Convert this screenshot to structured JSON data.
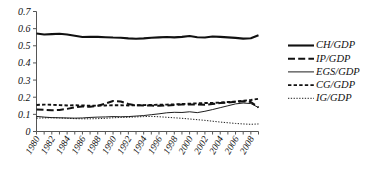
{
  "chart_data": {
    "type": "line",
    "title": "",
    "subtitle": "",
    "xlabel": "",
    "ylabel": "",
    "xlim": [
      1980,
      2009
    ],
    "ylim": [
      0,
      0.7
    ],
    "grid": false,
    "legend_position": "right",
    "y_ticks": [
      "0",
      "0.1",
      "0.2",
      "0.3",
      "0.4",
      "0.5",
      "0.6",
      "0.7"
    ],
    "y_tick_values": [
      0,
      0.1,
      0.2,
      0.3,
      0.4,
      0.5,
      0.6,
      0.7
    ],
    "x_tick_labels": [
      "1980",
      "1982",
      "1984",
      "1986",
      "1988",
      "1990",
      "1992",
      "1994",
      "1996",
      "1998",
      "2000",
      "2002",
      "2004",
      "2006",
      "2008"
    ],
    "x": [
      1980,
      1981,
      1982,
      1983,
      1984,
      1985,
      1986,
      1987,
      1988,
      1989,
      1990,
      1991,
      1992,
      1993,
      1994,
      1995,
      1996,
      1997,
      1998,
      1999,
      2000,
      2001,
      2002,
      2003,
      2004,
      2005,
      2006,
      2007,
      2008,
      2009
    ],
    "series": [
      {
        "name": "CH/GDP",
        "style": "solid-thick",
        "color": "#111111",
        "values": [
          0.572,
          0.566,
          0.568,
          0.57,
          0.566,
          0.558,
          0.551,
          0.553,
          0.552,
          0.55,
          0.548,
          0.547,
          0.543,
          0.541,
          0.543,
          0.547,
          0.549,
          0.551,
          0.549,
          0.552,
          0.557,
          0.55,
          0.548,
          0.554,
          0.552,
          0.549,
          0.546,
          0.542,
          0.544,
          0.562
        ]
      },
      {
        "name": "IP/GDP",
        "style": "dashed-long-thick",
        "color": "#111111",
        "values": [
          0.128,
          0.126,
          0.124,
          0.126,
          0.132,
          0.141,
          0.146,
          0.144,
          0.15,
          0.163,
          0.178,
          0.175,
          0.16,
          0.153,
          0.152,
          0.151,
          0.15,
          0.152,
          0.155,
          0.157,
          0.158,
          0.158,
          0.156,
          0.16,
          0.166,
          0.169,
          0.173,
          0.176,
          0.172,
          0.14
        ]
      },
      {
        "name": "EGS/GDP",
        "style": "solid-thin",
        "color": "#111111",
        "values": [
          0.088,
          0.084,
          0.081,
          0.08,
          0.079,
          0.078,
          0.079,
          0.082,
          0.084,
          0.085,
          0.087,
          0.086,
          0.087,
          0.09,
          0.093,
          0.098,
          0.103,
          0.109,
          0.112,
          0.111,
          0.115,
          0.11,
          0.118,
          0.128,
          0.139,
          0.15,
          0.161,
          0.166,
          0.163,
          0.14
        ]
      },
      {
        "name": "CG/GDP",
        "style": "dashed-med-thick",
        "color": "#111111",
        "values": [
          0.155,
          0.157,
          0.156,
          0.154,
          0.152,
          0.153,
          0.152,
          0.15,
          0.151,
          0.152,
          0.153,
          0.153,
          0.152,
          0.153,
          0.154,
          0.155,
          0.156,
          0.157,
          0.158,
          0.16,
          0.162,
          0.164,
          0.166,
          0.167,
          0.169,
          0.172,
          0.175,
          0.179,
          0.184,
          0.191
        ]
      },
      {
        "name": "IG/GDP",
        "style": "dotted-thin",
        "color": "#111111",
        "values": [
          0.078,
          0.079,
          0.08,
          0.079,
          0.077,
          0.075,
          0.074,
          0.074,
          0.075,
          0.077,
          0.08,
          0.082,
          0.083,
          0.085,
          0.087,
          0.088,
          0.086,
          0.083,
          0.08,
          0.077,
          0.073,
          0.069,
          0.065,
          0.06,
          0.055,
          0.051,
          0.047,
          0.044,
          0.042,
          0.044
        ]
      }
    ]
  }
}
